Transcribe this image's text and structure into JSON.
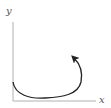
{
  "diagram": {
    "axes": {
      "x_label": "x",
      "y_label": "y",
      "axis_color": "#b0b0b0"
    },
    "curve": {
      "color": "#222222",
      "description": "curve starting on y-axis, dipping toward x-axis, then curving up with an arrowhead",
      "arrow": true
    }
  }
}
